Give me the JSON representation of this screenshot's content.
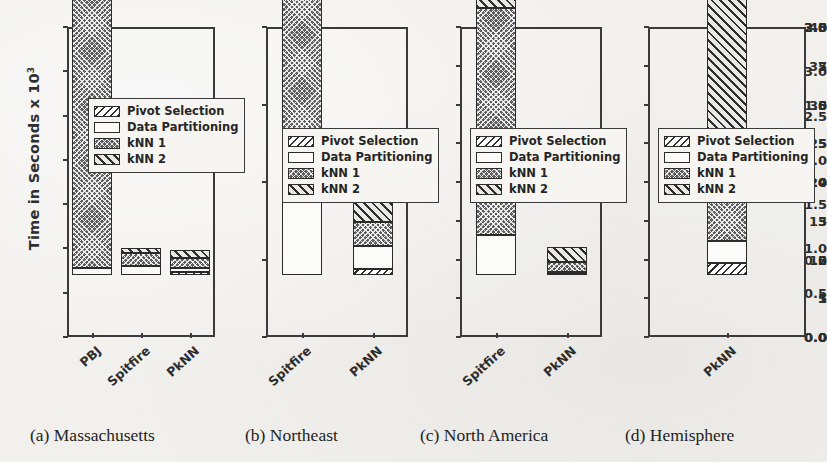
{
  "figure": {
    "ylabel": "Time in Seconds x 10",
    "ylabel_exponent": "3",
    "legend": [
      {
        "name": "Pivot Selection",
        "pattern": "p-pivot"
      },
      {
        "name": "Data Partitioning",
        "pattern": "p-data"
      },
      {
        "name": "kNN 1",
        "pattern": "p-knn1"
      },
      {
        "name": "kNN 2",
        "pattern": "p-knn2"
      }
    ],
    "captions": [
      {
        "label": "(a) Massachusetts"
      },
      {
        "label": "(b) Northeast"
      },
      {
        "label": "(c) North America"
      },
      {
        "label": "(d) Hemisphere"
      }
    ]
  },
  "chart_data": [
    {
      "type": "bar",
      "subplot": "a",
      "title": "(a) Massachusetts",
      "xlabel": "",
      "ylabel": "Time in Seconds x 10^3",
      "categories": [
        "PBJ",
        "Spitfire",
        "PkNN"
      ],
      "ylim": [
        0.0,
        3.5
      ],
      "yticks": [
        "0.0",
        "0.5",
        "1.0",
        "1.5",
        "2.0",
        "2.5",
        "3.0",
        "3.5"
      ],
      "ytick_values": [
        0.0,
        0.5,
        1.0,
        1.5,
        2.0,
        2.5,
        3.0,
        3.5
      ],
      "stacked": true,
      "grid": false,
      "legend_position": "upper-left-inside",
      "series": [
        {
          "name": "Pivot Selection",
          "values": [
            0.0,
            0.0,
            0.03
          ]
        },
        {
          "name": "Data Partitioning",
          "values": [
            0.08,
            0.1,
            0.05
          ]
        },
        {
          "name": "kNN 1",
          "values": [
            3.27,
            0.15,
            0.11
          ]
        },
        {
          "name": "kNN 2",
          "values": [
            0.0,
            0.06,
            0.09
          ]
        }
      ],
      "totals": [
        3.35,
        0.31,
        0.28
      ]
    },
    {
      "type": "bar",
      "subplot": "b",
      "title": "(b) Northeast",
      "xlabel": "",
      "ylabel": "",
      "categories": [
        "Spitfire",
        "PkNN"
      ],
      "ylim": [
        0.0,
        2.0
      ],
      "yticks": [
        "0.0",
        "0.5",
        "1.0",
        "1.5",
        "2.0"
      ],
      "ytick_values": [
        0.0,
        0.5,
        1.0,
        1.5,
        2.0
      ],
      "stacked": true,
      "grid": false,
      "legend_position": "middle-inside",
      "series": [
        {
          "name": "Pivot Selection",
          "values": [
            0.0,
            0.04
          ]
        },
        {
          "name": "Data Partitioning",
          "values": [
            0.51,
            0.15
          ]
        },
        {
          "name": "kNN 1",
          "values": [
            1.35,
            0.15
          ]
        },
        {
          "name": "kNN 2",
          "values": [
            0.14,
            0.23
          ]
        }
      ],
      "totals": [
        2.0,
        0.57
      ],
      "notes": "Spitfire bar is clipped at the top of the axis (2.0)"
    },
    {
      "type": "bar",
      "subplot": "c",
      "title": "(c) North America",
      "xlabel": "",
      "ylabel": "",
      "categories": [
        "Spitfire",
        "PkNN"
      ],
      "ylim": [
        0,
        40
      ],
      "yticks": [
        "0",
        "5",
        "10",
        "15",
        "20",
        "25",
        "30",
        "35",
        "40"
      ],
      "ytick_values": [
        0,
        5,
        10,
        15,
        20,
        25,
        30,
        35,
        40
      ],
      "stacked": true,
      "grid": false,
      "legend_position": "middle-inside",
      "series": [
        {
          "name": "Pivot Selection",
          "values": [
            0.0,
            0.1
          ]
        },
        {
          "name": "Data Partitioning",
          "values": [
            5.1,
            0.3
          ]
        },
        {
          "name": "kNN 1",
          "values": [
            29.4,
            1.3
          ]
        },
        {
          "name": "kNN 2",
          "values": [
            1.7,
            1.9
          ]
        }
      ],
      "totals": [
        36.2,
        3.6
      ]
    },
    {
      "type": "bar",
      "subplot": "d",
      "title": "(d) Hemisphere",
      "xlabel": "",
      "ylabel": "",
      "categories": [
        "PkNN"
      ],
      "ylim": [
        0,
        8
      ],
      "yticks": [
        "0",
        "1",
        "2",
        "3",
        "4",
        "5",
        "6",
        "7",
        "8"
      ],
      "ytick_values": [
        0,
        1,
        2,
        3,
        4,
        5,
        6,
        7,
        8
      ],
      "stacked": true,
      "grid": false,
      "legend_position": "middle-inside",
      "series": [
        {
          "name": "Pivot Selection",
          "values": [
            0.3
          ]
        },
        {
          "name": "Data Partitioning",
          "values": [
            0.57
          ]
        },
        {
          "name": "kNN 1",
          "values": [
            1.51
          ]
        },
        {
          "name": "kNN 2",
          "values": [
            5.12
          ]
        }
      ],
      "totals": [
        7.5
      ]
    }
  ]
}
